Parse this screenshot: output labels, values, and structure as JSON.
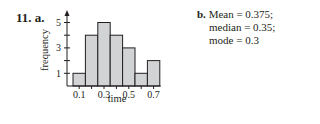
{
  "problem": {
    "number_label": "11. a.",
    "part_b": {
      "letter": "b.",
      "lines": [
        "Mean = 0.375;",
        "median = 0.35;",
        "mode = 0.3"
      ]
    }
  },
  "chart_data": {
    "type": "bar",
    "title": "",
    "xlabel": "time",
    "ylabel": "frequency",
    "categories": [
      "0.1",
      "0.2",
      "0.3",
      "0.4",
      "0.5",
      "0.6",
      "0.7"
    ],
    "values": [
      1,
      4,
      5,
      4,
      3,
      1,
      2
    ],
    "x_tick_labels": [
      "0.1",
      "0.3",
      "0.5",
      "0.7"
    ],
    "y_tick_labels": [
      "1",
      "3",
      "5"
    ],
    "y_ticks": [
      1,
      2,
      3,
      4,
      5
    ],
    "ylim": [
      0,
      5.6
    ],
    "grid": false,
    "bar_color": "#d1d3d4",
    "edge_color": "#231f20"
  }
}
